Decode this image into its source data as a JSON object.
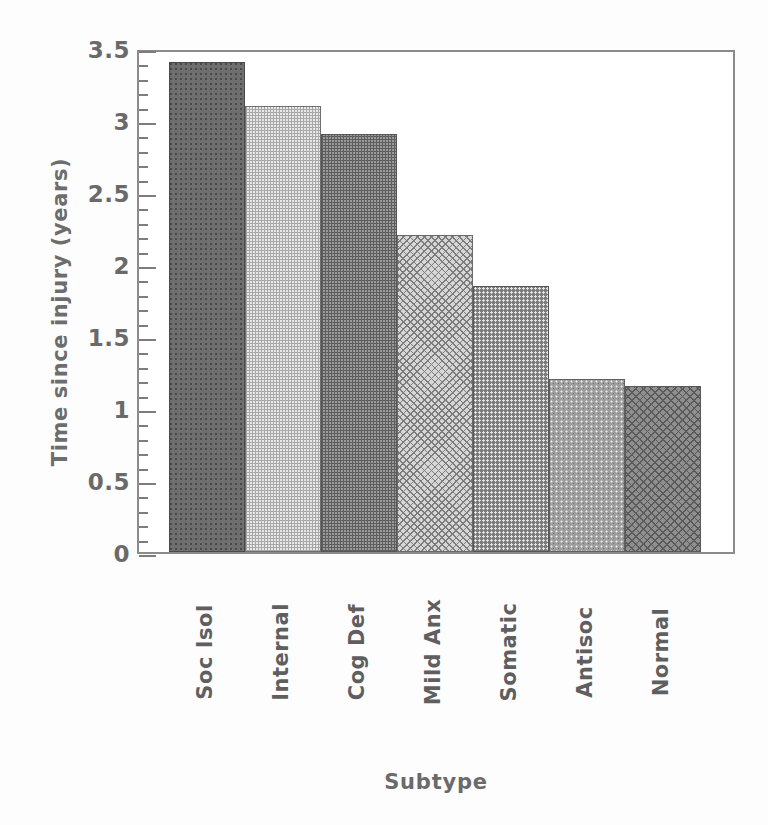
{
  "chart_data": {
    "type": "bar",
    "title": "",
    "xlabel": "Subtype",
    "ylabel": "Time since injury (years)",
    "categories": [
      "Soc Isol",
      "Internal",
      "Cog Def",
      "Mild Anx",
      "Somatic",
      "Antisoc",
      "Normal"
    ],
    "values": [
      3.4,
      3.1,
      2.9,
      2.2,
      1.85,
      1.2,
      1.15
    ],
    "ylim": [
      0,
      3.5
    ],
    "xlim_note": "categorical, 7 contiguous bars, no gaps",
    "ytick_labels": [
      "0",
      "0.5",
      "1",
      "1.5",
      "2",
      "2.5",
      "3",
      "3.5"
    ],
    "ytick_values": [
      0,
      0.5,
      1,
      1.5,
      2,
      2.5,
      3,
      3.5
    ],
    "minor_tick_interval": 0.1,
    "major_tick_interval": 0.5,
    "grid": false,
    "legend": false,
    "legend_position": "none",
    "bar_fills": [
      "solid-dark",
      "grid-light",
      "grid-dark",
      "crosshatch-light",
      "dots-dark",
      "dots-mid",
      "crosshatch-dark"
    ],
    "colors": {
      "axis": "#8b8b8b",
      "text": "#6a6a6a",
      "background": "#ffffff",
      "bar_solid_dark": "#6e6e6e",
      "bar_grid_light": "#e8e8e8",
      "bar_grid_dark": "#9a9a9a",
      "bar_crosshatch_light": "#d6d6d6",
      "bar_dots_dark": "#7c7c7c",
      "bar_dots_mid": "#9e9e9e",
      "bar_crosshatch_dark": "#8f8f8f"
    }
  }
}
